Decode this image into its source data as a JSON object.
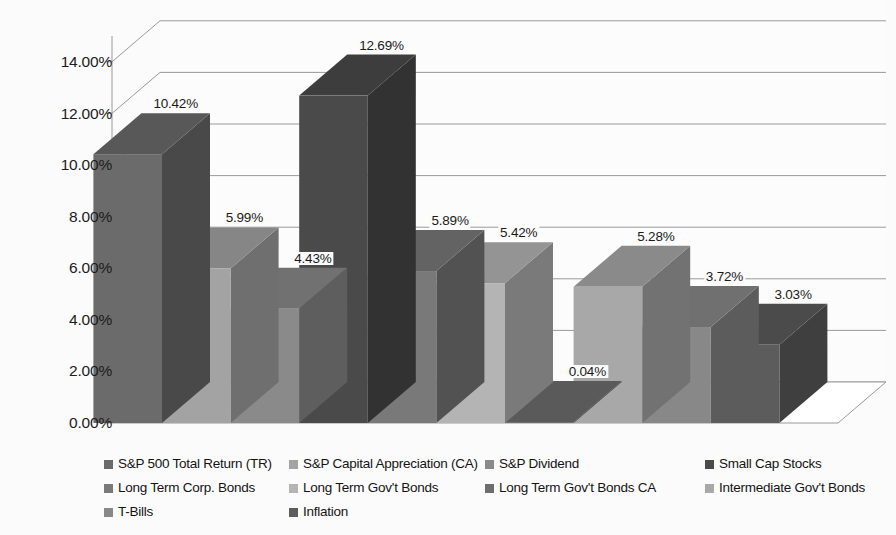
{
  "chart_data": {
    "type": "bar",
    "title": "",
    "subtitle": "",
    "xlabel": "",
    "ylabel": "",
    "ylim": [
      0,
      15
    ],
    "grid": true,
    "legend_position": "bottom",
    "style": "3d-column",
    "categories": [
      "S&P 500 Total Return (TR)",
      "S&P Capital Appreciation (CA)",
      "S&P Dividend",
      "Small Cap Stocks",
      "Long Term Corp. Bonds",
      "Long Term Gov't Bonds",
      "Long Term Gov't Bonds CA",
      "Intermediate Gov't Bonds",
      "T-Bills",
      "Inflation"
    ],
    "values": [
      10.42,
      5.99,
      4.43,
      12.69,
      5.89,
      5.42,
      0.04,
      5.28,
      3.72,
      3.03
    ],
    "data_labels": [
      "10.42%",
      "5.99%",
      "4.43%",
      "12.69%",
      "5.89%",
      "5.42%",
      "0.04%",
      "5.28%",
      "3.72%",
      "3.03%"
    ],
    "yticks": [
      0,
      2,
      4,
      6,
      8,
      10,
      12,
      14
    ],
    "ytick_labels": [
      "0.00%",
      "2.00%",
      "4.00%",
      "6.00%",
      "8.00%",
      "10.00%",
      "12.00%",
      "14.00%"
    ],
    "series_colors": [
      "#6b6b6b",
      "#a3a3a3",
      "#8a8a8a",
      "#4a4a4a",
      "#797979",
      "#b4b4b4",
      "#6e6e6e",
      "#a8a8a8",
      "#888888",
      "#5c5c5c"
    ]
  },
  "yaxis": {
    "labels": [
      {
        "text": "14.00%"
      },
      {
        "text": "12.00%"
      },
      {
        "text": "10.00%"
      },
      {
        "text": "8.00%"
      },
      {
        "text": "6.00%"
      },
      {
        "text": "4.00%"
      },
      {
        "text": "2.00%"
      },
      {
        "text": "0.00%"
      }
    ]
  },
  "bars": [
    {
      "label": "10.42%",
      "name": "sp500-total-return"
    },
    {
      "label": "5.99%",
      "name": "sp-capital-appreciation"
    },
    {
      "label": "4.43%",
      "name": "sp-dividend"
    },
    {
      "label": "12.69%",
      "name": "small-cap-stocks"
    },
    {
      "label": "5.89%",
      "name": "long-term-corp-bonds"
    },
    {
      "label": "5.42%",
      "name": "long-term-govt-bonds"
    },
    {
      "label": "0.04%",
      "name": "long-term-govt-bonds-ca"
    },
    {
      "label": "5.28%",
      "name": "intermediate-govt-bonds"
    },
    {
      "label": "3.72%",
      "name": "t-bills"
    },
    {
      "label": "3.03%",
      "name": "inflation"
    }
  ],
  "legend": {
    "rows": [
      [
        {
          "label": "S&P 500 Total Return (TR)",
          "color": "#6b6b6b",
          "col": "lg-c0"
        },
        {
          "label": "S&P Capital Appreciation (CA)",
          "color": "#a3a3a3",
          "col": "lg-c1"
        },
        {
          "label": "S&P Dividend",
          "color": "#8a8a8a",
          "col": "lg-c2"
        },
        {
          "label": "Small Cap Stocks",
          "color": "#4a4a4a",
          "col": "lg-c3"
        }
      ],
      [
        {
          "label": "Long Term Corp. Bonds",
          "color": "#797979",
          "col": "lg-c0"
        },
        {
          "label": "Long Term Gov't Bonds",
          "color": "#b4b4b4",
          "col": "lg-c1"
        },
        {
          "label": "Long Term Gov't Bonds CA",
          "color": "#6e6e6e",
          "col": "lg-c2"
        },
        {
          "label": "Intermediate Gov't Bonds",
          "color": "#a8a8a8",
          "col": "lg-c3"
        }
      ],
      [
        {
          "label": "T-Bills",
          "color": "#888888",
          "col": "lg-c0"
        },
        {
          "label": "Inflation",
          "color": "#5c5c5c",
          "col": "lg-c1"
        }
      ]
    ]
  }
}
